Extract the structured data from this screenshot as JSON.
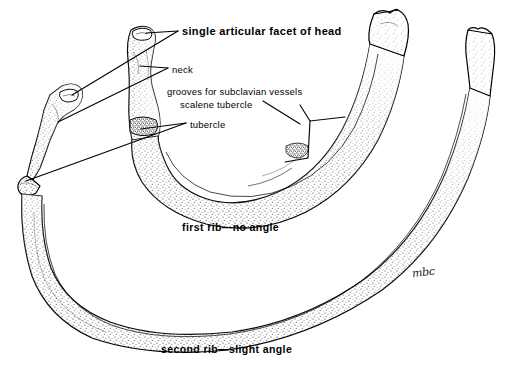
{
  "figure": {
    "background_color": "#ffffff",
    "ink_color": "#000000",
    "width": 514,
    "height": 365
  },
  "callouts": [
    {
      "id": "facet",
      "label": "single articular facet of head",
      "weight": "bold",
      "x": 182,
      "y": 26
    },
    {
      "id": "neck",
      "label": "neck",
      "weight": "regular",
      "x": 172,
      "y": 65
    },
    {
      "id": "grooves",
      "label": "grooves for subclavian vessels",
      "weight": "regular",
      "x": 167,
      "y": 87
    },
    {
      "id": "scalene",
      "label": "scalene tubercle",
      "weight": "regular",
      "x": 180,
      "y": 100
    },
    {
      "id": "tubercle",
      "label": "tubercle",
      "weight": "regular",
      "x": 190,
      "y": 120
    }
  ],
  "captions": [
    {
      "id": "first-rib",
      "label": "first rib—no angle",
      "x": 182,
      "y": 222
    },
    {
      "id": "second-rib",
      "label": "second rib—slight angle",
      "x": 161,
      "y": 344
    }
  ],
  "signature": {
    "label": "mbc",
    "x": 412,
    "y": 266
  },
  "specimens": [
    {
      "id": "first-rib",
      "name": "first rib",
      "features": [
        "head",
        "neck",
        "tubercle",
        "scalene tubercle",
        "groove for subclavian vein",
        "groove for subclavian artery",
        "sternal end"
      ]
    },
    {
      "id": "second-rib",
      "name": "second rib",
      "features": [
        "head",
        "neck",
        "tubercle",
        "angle",
        "shaft",
        "sternal end"
      ]
    }
  ]
}
